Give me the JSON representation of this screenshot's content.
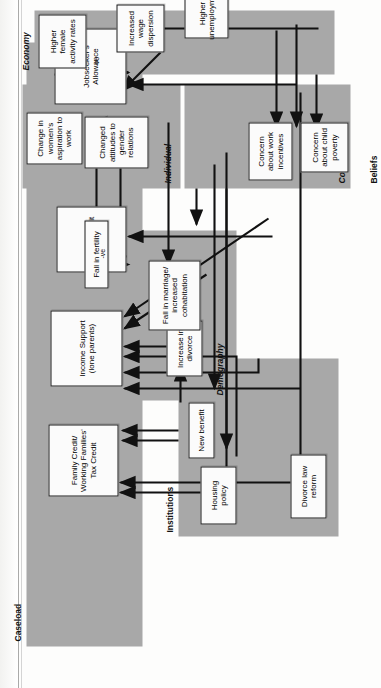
{
  "page": {
    "ghost_title_line1": "Locating Policy Impact",
    "ghost_title_line2": "within Causal Chains"
  },
  "diagram": {
    "zones": [
      {
        "key": "caseload",
        "label": "Caseload"
      },
      {
        "key": "institutions",
        "label": "Institutions"
      },
      {
        "key": "demography",
        "label": "Demography"
      },
      {
        "key": "beliefs",
        "label": "Beliefs"
      },
      {
        "key": "collective",
        "label": "Collective"
      },
      {
        "key": "individual",
        "label": "Individual"
      },
      {
        "key": "economy",
        "label": "Economy"
      }
    ],
    "nodes": [
      {
        "key": "fc",
        "label": "Family Credit/ Working Families' Tax Credit"
      },
      {
        "key": "is",
        "label": "Income Support (lone parents)"
      },
      {
        "key": "cb",
        "label": "Child Benefit"
      },
      {
        "key": "jsa",
        "label": "Jobseeker's Allowance"
      },
      {
        "key": "nb",
        "label": "New benefit"
      },
      {
        "key": "hp",
        "label": "Housing policy"
      },
      {
        "key": "dlr",
        "label": "Divorce law reform"
      },
      {
        "key": "inc_div",
        "label": "Increase in divorce"
      },
      {
        "key": "fall_marr",
        "label": "Fall in marriage/ increased cohabitation"
      },
      {
        "key": "fall_fert",
        "label": "Fall in fertility"
      },
      {
        "key": "cchild",
        "label": "Concern about child poverty"
      },
      {
        "key": "cwork",
        "label": "Concern about work incentives"
      },
      {
        "key": "catt",
        "label": "Changed attitudes to gender relations"
      },
      {
        "key": "cwomen",
        "label": "Change in women's aspiration to work"
      },
      {
        "key": "hfar",
        "label": "Higher female activity rates"
      },
      {
        "key": "iwd",
        "label": "Increased wage dispersion"
      },
      {
        "key": "hun",
        "label": "Higher unemployment"
      }
    ],
    "edge_labels": [
      {
        "key": "neg1",
        "text": "-ve"
      },
      {
        "key": "neg2",
        "text": "-ve"
      }
    ]
  },
  "colors": {
    "zone_fill": "#a8a8a8",
    "node_fill": "#fbfbfb",
    "stroke": "#111111",
    "page": "#ffffff"
  }
}
